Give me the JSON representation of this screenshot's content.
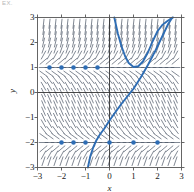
{
  "figure": {
    "corner_label": "EX.",
    "background": "#ffffff"
  },
  "colors": {
    "curve": "#2E6DB4",
    "point": "#2E6DB4",
    "slope_field": "#4a5464",
    "frame": "#555555",
    "axis": "#333333",
    "text": "#1a1a1a"
  },
  "axes": {
    "x_title": "x",
    "y_title": "y",
    "x_ticks": [
      "−3",
      "−2",
      "−1",
      "0",
      "1",
      "2",
      "3"
    ],
    "y_ticks": [
      "3",
      "2",
      "1",
      "0",
      "−1",
      "−2",
      "−3"
    ],
    "x_tick_values": [
      -3,
      -2,
      -1,
      0,
      1,
      2,
      3
    ],
    "y_tick_values": [
      3,
      2,
      1,
      0,
      -1,
      -2,
      -3
    ]
  },
  "chart_data": {
    "type": "line",
    "title": "",
    "subtitle": "",
    "xlabel": "x",
    "ylabel": "y",
    "xlim": [
      -3,
      3
    ],
    "ylim": [
      -3,
      3
    ],
    "grid": false,
    "legend": "none",
    "plot_kind": "slope-field-with-solution-curves",
    "slope_field": {
      "description": "Dashed direction-field segments on a regular grid",
      "x_start": -2.75,
      "x_step": 0.25,
      "x_count": 23,
      "y_start": -2.75,
      "y_step": 0.25,
      "y_count": 23,
      "slope_formula": "dy/dx = (y - 1) * (y + 2)",
      "segment_length": 0.2,
      "style": "dashed",
      "color": "#4a5464"
    },
    "equilibrium_points": {
      "marker": "filled-circle",
      "radius_px": 2.3,
      "color": "#2E6DB4",
      "series": [
        {
          "name": "y = 1 equilibrium markers",
          "y": 1,
          "x": [
            -2.5,
            -2.0,
            -1.5,
            -1.0,
            -0.5
          ]
        },
        {
          "name": "y = -2 equilibrium markers",
          "y": -2,
          "x": [
            -2.0,
            -1.5,
            -1.0,
            0.0,
            1.0,
            2.0
          ]
        }
      ]
    },
    "series": [
      {
        "name": "solution-curve-upper",
        "shape": "U-shaped curve with minimum near (1, 1)",
        "color": "#2E6DB4",
        "x": [
          0.2,
          0.35,
          0.5,
          0.65,
          0.8,
          1.0,
          1.2,
          1.4,
          1.6,
          1.8,
          2.0,
          2.2,
          2.4,
          2.55,
          2.65
        ],
        "y": [
          3.0,
          2.35,
          1.85,
          1.45,
          1.18,
          1.02,
          1.05,
          1.25,
          1.6,
          2.05,
          2.45,
          2.7,
          2.85,
          2.95,
          3.0
        ]
      },
      {
        "name": "solution-curve-lower",
        "shape": "S-shaped curve rising from (-0.9, -3) through (0, -1) toward (2.6, 3)",
        "color": "#2E6DB4",
        "x": [
          -0.9,
          -0.8,
          -0.68,
          -0.55,
          -0.4,
          -0.22,
          0.0,
          0.25,
          0.5,
          0.75,
          1.0,
          1.3,
          1.6,
          1.9,
          2.2,
          2.45,
          2.62
        ],
        "y": [
          -3.0,
          -2.55,
          -2.2,
          -1.92,
          -1.68,
          -1.45,
          -1.12,
          -0.78,
          -0.45,
          -0.15,
          0.15,
          0.6,
          1.1,
          1.65,
          2.25,
          2.75,
          3.0
        ]
      }
    ]
  }
}
